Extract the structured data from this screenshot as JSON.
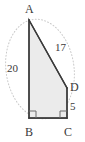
{
  "figure": {
    "kind": "geometry-diagram",
    "shape": "right-trapezoid",
    "canvas": {
      "width": 85,
      "height": 142
    },
    "colors": {
      "background": "#ffffff",
      "stroke": "#3a3a3a",
      "fill": "#ebebeb",
      "guide": "#c9c9c9",
      "text": "#3a3a3a"
    },
    "vertices": [
      {
        "name": "A",
        "label": "A",
        "x": 29,
        "y": 20
      },
      {
        "name": "B",
        "label": "B",
        "x": 29,
        "y": 118
      },
      {
        "name": "C",
        "label": "C",
        "x": 67,
        "y": 118
      },
      {
        "name": "D",
        "label": "D",
        "x": 67,
        "y": 88
      }
    ],
    "sides": [
      {
        "name": "AB",
        "from": "A",
        "to": "B",
        "length_label": "20"
      },
      {
        "name": "AD",
        "from": "A",
        "to": "D",
        "length_label": "17"
      },
      {
        "name": "DC",
        "from": "D",
        "to": "C",
        "length_label": "5"
      },
      {
        "name": "BC",
        "from": "B",
        "to": "C",
        "length_label": ""
      }
    ],
    "right_angles": [
      {
        "at": "B",
        "marker": "square"
      },
      {
        "at": "C",
        "marker": "square"
      }
    ],
    "guide_curve": {
      "name": "dotted-ellipse",
      "style": "dotted",
      "passes_through": [
        "A",
        "B",
        "D"
      ]
    }
  },
  "labels": {
    "A": "A",
    "B": "B",
    "C": "C",
    "D": "D",
    "side_AB": "20",
    "side_AD": "17",
    "side_DC": "5"
  }
}
